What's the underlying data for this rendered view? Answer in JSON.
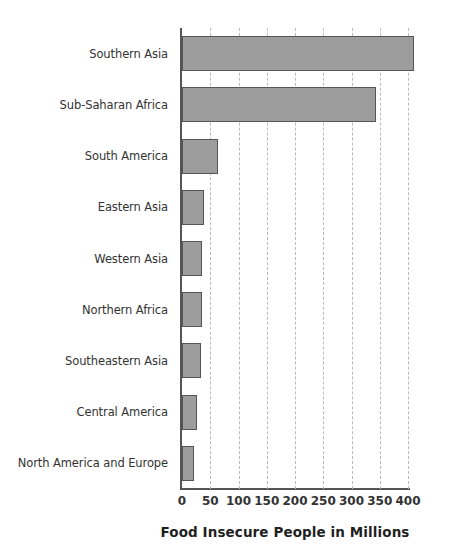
{
  "chart_data": {
    "type": "bar",
    "orientation": "horizontal",
    "title": "",
    "xlabel": "Food Insecure People in Millions",
    "ylabel": "",
    "xlim": [
      0,
      400
    ],
    "xticks": [
      0,
      50,
      100,
      150,
      200,
      250,
      300,
      350,
      400
    ],
    "xtick_labels": [
      "0",
      "50",
      "100",
      "150",
      "200",
      "250",
      "300",
      "350",
      "400"
    ],
    "grid": "vertical-dashed",
    "legend": "none",
    "bar_color": "#9d9d9d",
    "bar_edge_color": "#555555",
    "axis_color": "#555555",
    "gridline_color": "#b9b9b9",
    "text_color": "#333333",
    "categories": [
      "Southern Asia",
      "Sub-Saharan Africa",
      "South America",
      "Eastern Asia",
      "Western Asia",
      "Northern Africa",
      "Southeastern Asia",
      "Central America",
      "North America and Europe"
    ],
    "values": [
      411,
      344,
      64,
      39,
      36,
      35,
      34,
      26,
      22
    ]
  }
}
